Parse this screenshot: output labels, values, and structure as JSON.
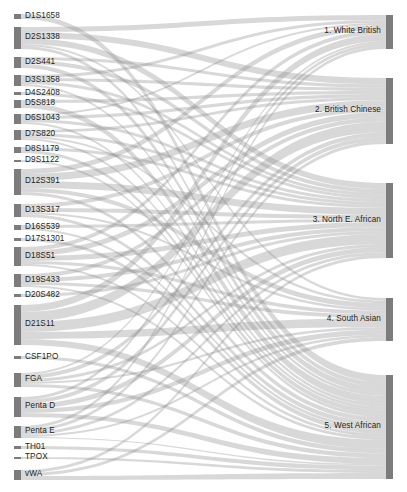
{
  "chart_data": {
    "type": "sankey",
    "title": "",
    "subtitle": "",
    "xlabel": "",
    "ylabel": "",
    "legend_position": "none",
    "grid": false,
    "orientation": "left-to-right",
    "node_color": "#7c7c7c",
    "link_color": "#8c8c8c",
    "link_opacity": 0.34,
    "background": "#ffffff",
    "source_axis_label": "STR marker locus",
    "target_axis_label": "Population group",
    "sources": [
      {
        "id": "D1S1658",
        "label": "D1S1658",
        "value": 5,
        "y0": 14,
        "y1": 19,
        "label_y": 16.5
      },
      {
        "id": "D2S1338",
        "label": "D2S1338",
        "value": 22,
        "y0": 27,
        "y1": 49,
        "label_y": 38.0
      },
      {
        "id": "D2S441",
        "label": "D2S441",
        "value": 11,
        "y0": 57,
        "y1": 68,
        "label_y": 62.5
      },
      {
        "id": "D3S1358",
        "label": "D3S1358",
        "value": 11,
        "y0": 75,
        "y1": 86,
        "label_y": 80.5
      },
      {
        "id": "D4S2408",
        "label": "D4S2408",
        "value": 3,
        "y0": 92,
        "y1": 95,
        "label_y": 93.5
      },
      {
        "id": "D5S818",
        "label": "D5S818",
        "value": 8,
        "y0": 100,
        "y1": 108,
        "label_y": 104.0
      },
      {
        "id": "D6S1043",
        "label": "D6S1043",
        "value": 10,
        "y0": 114,
        "y1": 124,
        "label_y": 119.0
      },
      {
        "id": "D7S820",
        "label": "D7S820",
        "value": 10,
        "y0": 130,
        "y1": 140,
        "label_y": 135.0
      },
      {
        "id": "D8S1179",
        "label": "D8S1179",
        "value": 6,
        "y0": 147,
        "y1": 153,
        "label_y": 150.0
      },
      {
        "id": "D9S1122",
        "label": "D9S1122",
        "value": 2,
        "y0": 160,
        "y1": 162,
        "label_y": 161.0
      },
      {
        "id": "D12S391",
        "label": "D12S391",
        "value": 26,
        "y0": 169,
        "y1": 195,
        "label_y": 182.0
      },
      {
        "id": "D13S317",
        "label": "D13S317",
        "value": 13,
        "y0": 204,
        "y1": 217,
        "label_y": 210.5
      },
      {
        "id": "D16S539",
        "label": "D16S539",
        "value": 5,
        "y0": 225,
        "y1": 230,
        "label_y": 227.5
      },
      {
        "id": "D17S1301",
        "label": "D17S1301",
        "value": 3,
        "y0": 238,
        "y1": 241,
        "label_y": 239.5
      },
      {
        "id": "D18S51",
        "label": "D18S51",
        "value": 19,
        "y0": 247,
        "y1": 266,
        "label_y": 256.5
      },
      {
        "id": "D19S433",
        "label": "D19S433",
        "value": 13,
        "y0": 274,
        "y1": 287,
        "label_y": 280.5
      },
      {
        "id": "D20S482",
        "label": "D20S482",
        "value": 3,
        "y0": 294,
        "y1": 297,
        "label_y": 295.5
      },
      {
        "id": "D21S11",
        "label": "D21S11",
        "value": 40,
        "y0": 305,
        "y1": 345,
        "label_y": 325.0
      },
      {
        "id": "CSF1PO",
        "label": "CSF1PO",
        "value": 3,
        "y0": 356,
        "y1": 359,
        "label_y": 357.5
      },
      {
        "id": "FGA",
        "label": "FGA",
        "value": 14,
        "y0": 373,
        "y1": 387,
        "label_y": 380.0
      },
      {
        "id": "PentaD",
        "label": "Penta D",
        "value": 20,
        "y0": 397,
        "y1": 417,
        "label_y": 407.0
      },
      {
        "id": "PentaE",
        "label": "Penta E",
        "value": 12,
        "y0": 426,
        "y1": 438,
        "label_y": 432.0
      },
      {
        "id": "TH01",
        "label": "TH01",
        "value": 3,
        "y0": 446,
        "y1": 449,
        "label_y": 447.5
      },
      {
        "id": "TPOX",
        "label": "TPOX",
        "value": 2,
        "y0": 457,
        "y1": 459,
        "label_y": 458.0
      },
      {
        "id": "vWA",
        "label": "vWA",
        "value": 10,
        "y0": 470,
        "y1": 480,
        "label_y": 475.0
      }
    ],
    "targets": [
      {
        "id": "white_british",
        "label": "1. White British",
        "value": 34,
        "y0": 15,
        "y1": 49,
        "label_y": 32.0
      },
      {
        "id": "british_chinese",
        "label": "2. British Chinese",
        "value": 66,
        "y0": 78,
        "y1": 144,
        "label_y": 111.0
      },
      {
        "id": "north_e_african",
        "label": "3. North E. African",
        "value": 75,
        "y0": 183,
        "y1": 258,
        "label_y": 220.5
      },
      {
        "id": "south_asian",
        "label": "4. South Asian",
        "value": 43,
        "y0": 298,
        "y1": 341,
        "label_y": 319.5
      },
      {
        "id": "west_african",
        "label": "5. West African",
        "value": 104,
        "y0": 375,
        "y1": 479,
        "label_y": 427.0
      }
    ],
    "links": [
      {
        "source": "D1S1658",
        "target": "west_african",
        "value": 5
      },
      {
        "source": "D2S1338",
        "target": "white_british",
        "value": 5
      },
      {
        "source": "D2S1338",
        "target": "british_chinese",
        "value": 6
      },
      {
        "source": "D2S1338",
        "target": "north_e_african",
        "value": 6
      },
      {
        "source": "D2S1338",
        "target": "south_asian",
        "value": 2
      },
      {
        "source": "D2S1338",
        "target": "west_african",
        "value": 3
      },
      {
        "source": "D2S441",
        "target": "british_chinese",
        "value": 3
      },
      {
        "source": "D2S441",
        "target": "north_e_african",
        "value": 4
      },
      {
        "source": "D2S441",
        "target": "west_african",
        "value": 4
      },
      {
        "source": "D3S1358",
        "target": "white_british",
        "value": 3
      },
      {
        "source": "D3S1358",
        "target": "british_chinese",
        "value": 3
      },
      {
        "source": "D3S1358",
        "target": "north_e_african",
        "value": 3
      },
      {
        "source": "D3S1358",
        "target": "west_african",
        "value": 2
      },
      {
        "source": "D4S2408",
        "target": "north_e_african",
        "value": 3
      },
      {
        "source": "D5S818",
        "target": "british_chinese",
        "value": 3
      },
      {
        "source": "D5S818",
        "target": "west_african",
        "value": 5
      },
      {
        "source": "D6S1043",
        "target": "white_british",
        "value": 2
      },
      {
        "source": "D6S1043",
        "target": "british_chinese",
        "value": 3
      },
      {
        "source": "D6S1043",
        "target": "north_e_african",
        "value": 3
      },
      {
        "source": "D6S1043",
        "target": "west_african",
        "value": 2
      },
      {
        "source": "D7S820",
        "target": "british_chinese",
        "value": 3
      },
      {
        "source": "D7S820",
        "target": "north_e_african",
        "value": 3
      },
      {
        "source": "D7S820",
        "target": "south_asian",
        "value": 2
      },
      {
        "source": "D7S820",
        "target": "west_african",
        "value": 2
      },
      {
        "source": "D8S1179",
        "target": "north_e_african",
        "value": 3
      },
      {
        "source": "D8S1179",
        "target": "west_african",
        "value": 3
      },
      {
        "source": "D9S1122",
        "target": "west_african",
        "value": 2
      },
      {
        "source": "D12S391",
        "target": "white_british",
        "value": 5
      },
      {
        "source": "D12S391",
        "target": "british_chinese",
        "value": 7
      },
      {
        "source": "D12S391",
        "target": "north_e_african",
        "value": 7
      },
      {
        "source": "D12S391",
        "target": "south_asian",
        "value": 4
      },
      {
        "source": "D12S391",
        "target": "west_african",
        "value": 3
      },
      {
        "source": "D13S317",
        "target": "british_chinese",
        "value": 4
      },
      {
        "source": "D13S317",
        "target": "north_e_african",
        "value": 4
      },
      {
        "source": "D13S317",
        "target": "south_asian",
        "value": 2
      },
      {
        "source": "D13S317",
        "target": "west_african",
        "value": 3
      },
      {
        "source": "D16S539",
        "target": "north_e_african",
        "value": 3
      },
      {
        "source": "D16S539",
        "target": "west_african",
        "value": 2
      },
      {
        "source": "D17S1301",
        "target": "west_african",
        "value": 3
      },
      {
        "source": "D18S51",
        "target": "white_british",
        "value": 4
      },
      {
        "source": "D18S51",
        "target": "british_chinese",
        "value": 5
      },
      {
        "source": "D18S51",
        "target": "north_e_african",
        "value": 5
      },
      {
        "source": "D18S51",
        "target": "south_asian",
        "value": 3
      },
      {
        "source": "D18S51",
        "target": "west_african",
        "value": 2
      },
      {
        "source": "D19S433",
        "target": "british_chinese",
        "value": 4
      },
      {
        "source": "D19S433",
        "target": "north_e_african",
        "value": 4
      },
      {
        "source": "D19S433",
        "target": "south_asian",
        "value": 3
      },
      {
        "source": "D19S433",
        "target": "west_african",
        "value": 2
      },
      {
        "source": "D20S482",
        "target": "north_e_african",
        "value": 3
      },
      {
        "source": "D21S11",
        "target": "white_british",
        "value": 7
      },
      {
        "source": "D21S11",
        "target": "british_chinese",
        "value": 10
      },
      {
        "source": "D21S11",
        "target": "north_e_african",
        "value": 10
      },
      {
        "source": "D21S11",
        "target": "south_asian",
        "value": 7
      },
      {
        "source": "D21S11",
        "target": "west_african",
        "value": 6
      },
      {
        "source": "CSF1PO",
        "target": "west_african",
        "value": 3
      },
      {
        "source": "FGA",
        "target": "white_british",
        "value": 2
      },
      {
        "source": "FGA",
        "target": "british_chinese",
        "value": 4
      },
      {
        "source": "FGA",
        "target": "north_e_african",
        "value": 3
      },
      {
        "source": "FGA",
        "target": "south_asian",
        "value": 2
      },
      {
        "source": "FGA",
        "target": "west_african",
        "value": 3
      },
      {
        "source": "PentaD",
        "target": "white_british",
        "value": 3
      },
      {
        "source": "PentaD",
        "target": "british_chinese",
        "value": 4
      },
      {
        "source": "PentaD",
        "target": "north_e_african",
        "value": 5
      },
      {
        "source": "PentaD",
        "target": "south_asian",
        "value": 4
      },
      {
        "source": "PentaD",
        "target": "west_african",
        "value": 4
      },
      {
        "source": "PentaE",
        "target": "white_british",
        "value": 3
      },
      {
        "source": "PentaE",
        "target": "british_chinese",
        "value": 3
      },
      {
        "source": "PentaE",
        "target": "north_e_african",
        "value": 3
      },
      {
        "source": "PentaE",
        "target": "south_asian",
        "value": 2
      },
      {
        "source": "PentaE",
        "target": "west_african",
        "value": 1
      },
      {
        "source": "TH01",
        "target": "west_african",
        "value": 3
      },
      {
        "source": "TPOX",
        "target": "west_african",
        "value": 2
      },
      {
        "source": "vWA",
        "target": "north_e_african",
        "value": 3
      },
      {
        "source": "vWA",
        "target": "south_asian",
        "value": 3
      },
      {
        "source": "vWA",
        "target": "west_african",
        "value": 4
      }
    ]
  },
  "layout": {
    "width": 407,
    "height": 492,
    "left_node_x": 14,
    "left_node_width": 7,
    "right_node_x": 386,
    "right_node_width": 7,
    "left_label_x": 25,
    "right_label_x": 381
  }
}
